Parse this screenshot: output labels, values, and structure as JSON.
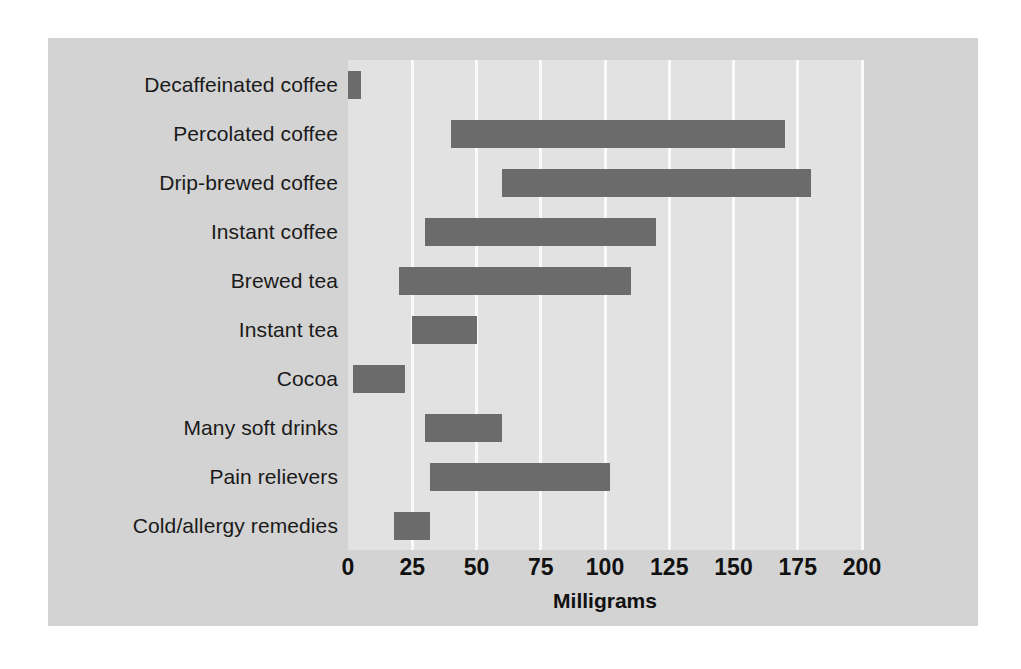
{
  "colors": {
    "page_background": "#ffffff",
    "panel_background": "#d3d3d3",
    "plot_background": "#e2e2e2",
    "bar": "#6b6b6b",
    "gridline": "#fafafa",
    "text": "#111111"
  },
  "chart_data": {
    "type": "bar",
    "orientation": "horizontal",
    "title": "",
    "subtitle": "",
    "xlabel": "Milligrams",
    "ylabel": "",
    "xlim": [
      0,
      200
    ],
    "xticks": [
      0,
      25,
      50,
      75,
      100,
      125,
      150,
      175,
      200
    ],
    "xtick_labels": [
      "0",
      "25",
      "50",
      "75",
      "100",
      "125",
      "150",
      "175",
      "200"
    ],
    "grid": true,
    "legend": false,
    "note": "Each bar is a range (floating bar) from a low to a high caffeine amount in milligrams.",
    "categories": [
      "Decaffeinated coffee",
      "Percolated coffee",
      "Drip-brewed coffee",
      "Instant coffee",
      "Brewed tea",
      "Instant tea",
      "Cocoa",
      "Many soft drinks",
      "Pain relievers",
      "Cold/allergy remedies"
    ],
    "ranges": [
      {
        "category": "Decaffeinated coffee",
        "low": 0,
        "high": 5
      },
      {
        "category": "Percolated coffee",
        "low": 40,
        "high": 170
      },
      {
        "category": "Drip-brewed coffee",
        "low": 60,
        "high": 180
      },
      {
        "category": "Instant coffee",
        "low": 30,
        "high": 120
      },
      {
        "category": "Brewed tea",
        "low": 20,
        "high": 110
      },
      {
        "category": "Instant tea",
        "low": 25,
        "high": 50
      },
      {
        "category": "Cocoa",
        "low": 2,
        "high": 22
      },
      {
        "category": "Many soft drinks",
        "low": 30,
        "high": 60
      },
      {
        "category": "Pain relievers",
        "low": 32,
        "high": 102
      },
      {
        "category": "Cold/allergy remedies",
        "low": 18,
        "high": 32
      }
    ]
  }
}
